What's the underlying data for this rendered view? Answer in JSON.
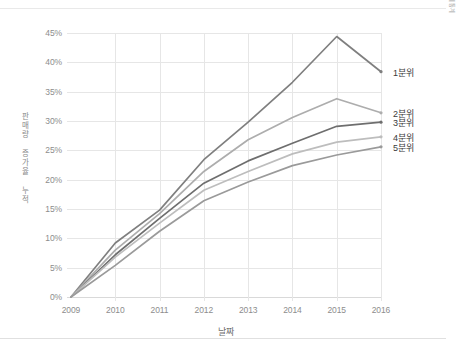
{
  "chart_data": {
    "type": "line",
    "title": "",
    "xlabel": "날짜",
    "ylabel": "판매량 증가율 누적",
    "source_note": "출처: 한국은행 경제통계",
    "x": [
      2009,
      2010,
      2011,
      2012,
      2013,
      2014,
      2015,
      2016
    ],
    "categories": [
      "2009",
      "2010",
      "2011",
      "2012",
      "2013",
      "2014",
      "2015",
      "2016"
    ],
    "xlim": [
      2009,
      2016
    ],
    "ylim": [
      0,
      45
    ],
    "ytick_labels": [
      "0%",
      "5%",
      "10%",
      "15%",
      "20%",
      "25%",
      "30%",
      "35%",
      "40%",
      "45%"
    ],
    "ytick_values": [
      0,
      5,
      10,
      15,
      20,
      25,
      30,
      35,
      40,
      45
    ],
    "grid": true,
    "legend_position": "right-inline-labels",
    "series": [
      {
        "name": "1분위",
        "color": "#7f7f7f",
        "values": [
          0,
          9.2,
          14.8,
          23.4,
          29.8,
          36.6,
          44.4,
          38.4
        ]
      },
      {
        "name": "2분위",
        "color": "#adadad",
        "values": [
          0,
          8.0,
          14.2,
          21.4,
          26.8,
          30.6,
          33.8,
          31.4
        ]
      },
      {
        "name": "3분위",
        "color": "#6e6e6e",
        "values": [
          0,
          7.2,
          13.4,
          19.4,
          23.2,
          26.2,
          29.1,
          29.8
        ]
      },
      {
        "name": "4분위",
        "color": "#bdbdbd",
        "values": [
          0,
          6.8,
          12.6,
          18.2,
          21.4,
          24.4,
          26.4,
          27.3
        ]
      },
      {
        "name": "5분위",
        "color": "#9a9a9a",
        "values": [
          0,
          5.4,
          11.2,
          16.4,
          19.6,
          22.4,
          24.2,
          25.6
        ]
      }
    ]
  }
}
